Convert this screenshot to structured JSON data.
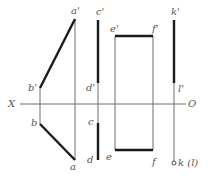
{
  "diagram": {
    "type": "orthographic-projection",
    "colors": {
      "thick": "#1a1a1a",
      "thin": "#6e6e6e",
      "label": "#555555",
      "background": "#ffffff"
    },
    "axis": {
      "left_label": "X",
      "right_label": "O"
    },
    "labels": {
      "a_prime": "a'",
      "b_prime": "b'",
      "a": "a",
      "b": "b",
      "c_prime": "c'",
      "d_prime": "d'",
      "c": "c",
      "d": "d",
      "e_prime": "e'",
      "f_prime": "f'",
      "e": "e",
      "f": "f",
      "k_prime": "k'",
      "l_prime": "l'",
      "k_l": "k (l)"
    },
    "segments": [
      {
        "name": "AB front view",
        "from": "b'",
        "to": "a'"
      },
      {
        "name": "AB top view",
        "from": "b",
        "to": "a"
      },
      {
        "name": "CD front view",
        "from": "c'",
        "to": "d'"
      },
      {
        "name": "CD top view",
        "from": "c",
        "to": "d"
      },
      {
        "name": "EF front view",
        "from": "e'",
        "to": "f'"
      },
      {
        "name": "EF top view",
        "from": "e",
        "to": "f"
      },
      {
        "name": "KL front view",
        "from": "k'",
        "to": "l'"
      },
      {
        "name": "KL top view",
        "point": "k (l)"
      }
    ]
  }
}
